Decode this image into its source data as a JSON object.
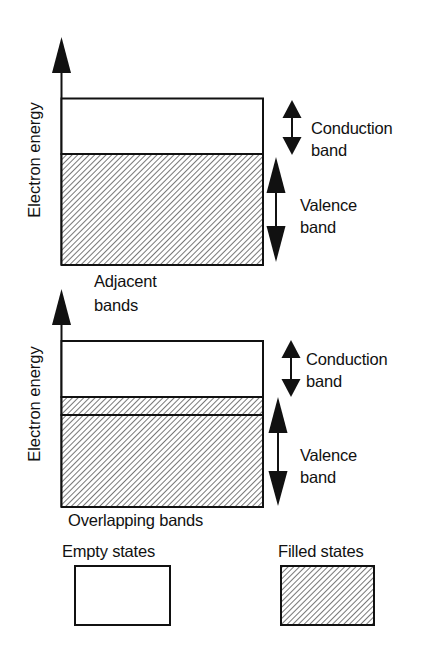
{
  "diagram": {
    "panels": [
      {
        "name": "adjacent",
        "axis_label": "Electron energy",
        "caption_line1": "Adjacent",
        "caption_line2": "bands",
        "conduction_label_line1": "Conduction",
        "conduction_label_line2": "band",
        "valence_label_line1": "Valence",
        "valence_label_line2": "band"
      },
      {
        "name": "overlapping",
        "axis_label": "Electron energy",
        "caption": "Overlapping bands",
        "conduction_label_line1": "Conduction",
        "conduction_label_line2": "band",
        "valence_label_line1": "Valence",
        "valence_label_line2": "band"
      }
    ],
    "legend": {
      "empty_label": "Empty states",
      "filled_label": "Filled states"
    },
    "colors": {
      "stroke": "#111111",
      "hatch": "#555555",
      "background": "#ffffff"
    }
  }
}
